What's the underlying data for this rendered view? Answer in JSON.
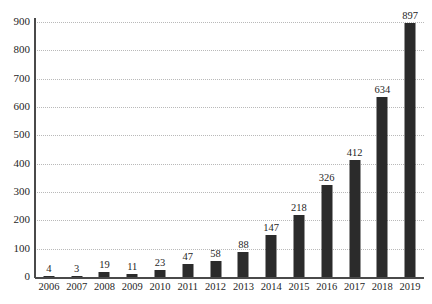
{
  "chart_data": {
    "type": "bar",
    "title": "",
    "subtitle": "",
    "xlabel": "",
    "ylabel": "",
    "categories": [
      "2006",
      "2007",
      "2008",
      "2009",
      "2010",
      "2011",
      "2012",
      "2013",
      "2014",
      "2015",
      "2016",
      "2017",
      "2018",
      "2019"
    ],
    "values": [
      4,
      3,
      19,
      11,
      23,
      47,
      58,
      88,
      147,
      218,
      326,
      412,
      634,
      897
    ],
    "data_labels": [
      "4",
      "3",
      "19",
      "11",
      "23",
      "47",
      "58",
      "88",
      "147",
      "218",
      "326",
      "412",
      "634",
      "897"
    ],
    "ylim": [
      0,
      900
    ],
    "y_ticks": [
      0,
      100,
      200,
      300,
      400,
      500,
      600,
      700,
      800,
      900
    ],
    "y_tick_labels": [
      "0",
      "100",
      "200",
      "300",
      "400",
      "500",
      "600",
      "700",
      "800",
      "900"
    ],
    "grid": true,
    "grid_axis": "y",
    "grid_style": "dotted",
    "legend": false,
    "legend_position": "none",
    "bar_color": "#2b2b2b",
    "grid_color": "#b9b9b9",
    "axis_color": "#4a4a4a",
    "background_color": "#ffffff",
    "show_data_labels": true
  }
}
